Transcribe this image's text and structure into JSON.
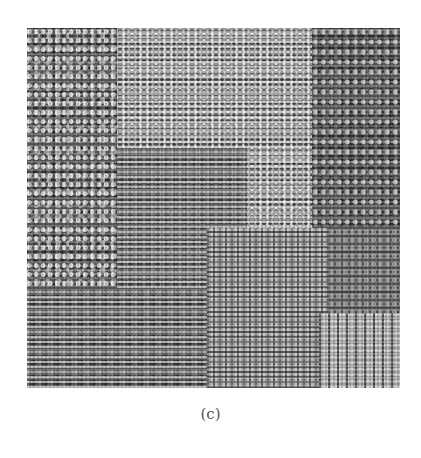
{
  "figure": {
    "caption": "(c)",
    "image_description": "grayscale texture mosaic",
    "colors": {
      "background": "#ffffff",
      "texture_dark": "#4a4a4a",
      "texture_light": "#e8e8e8",
      "caption_text": "#555555"
    }
  }
}
